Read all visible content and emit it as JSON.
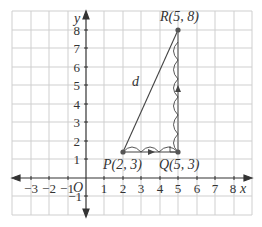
{
  "diagram": {
    "grid": {
      "x_min": -4,
      "x_max": 9,
      "y_min": -2,
      "y_max": 9
    },
    "axes": {
      "x_label": "x",
      "y_label": "y",
      "origin_label": "O",
      "x_ticks": [
        "−3",
        "−2",
        "−1",
        "1",
        "2",
        "3",
        "4",
        "5",
        "6",
        "7",
        "8"
      ],
      "y_ticks": [
        "8",
        "7",
        "6",
        "5",
        "4",
        "3",
        "2",
        "1",
        "−1"
      ]
    },
    "points": {
      "P": {
        "label": "P(2, 3)",
        "x": 2,
        "y": 3
      },
      "Q": {
        "label": "Q(5, 3)",
        "x": 5,
        "y": 3
      },
      "R": {
        "label": "R(5, 8)",
        "x": 5,
        "y": 8
      }
    },
    "segment_label": "d",
    "colors": {
      "grid": "#c8c8c8",
      "axis": "#333333",
      "line": "#333333"
    }
  }
}
